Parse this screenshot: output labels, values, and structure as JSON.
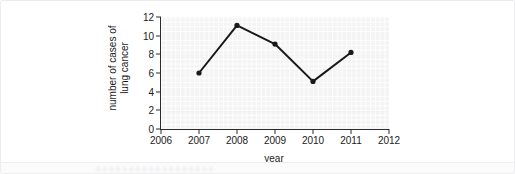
{
  "figure": {
    "background_color": "#ffffff",
    "plot_background_color": "#f4f4f5",
    "line_color": "#1a1a1a",
    "axis_color": "#2b2b2b"
  },
  "bottom_strip": {
    "obscured_text": "a a a a a a a a a a a a a a a a a a"
  },
  "chart_data": {
    "type": "line",
    "title": "",
    "xlabel": "year",
    "ylabel": "number of cases of lung cancer",
    "ylabel_lines": [
      "number of cases of",
      "lung cancer"
    ],
    "xlim": [
      2006,
      2012
    ],
    "ylim": [
      0,
      12
    ],
    "xticks": [
      2006,
      2007,
      2008,
      2009,
      2010,
      2011,
      2012
    ],
    "yticks": [
      0,
      2,
      4,
      6,
      8,
      10,
      12
    ],
    "xtick_labels": [
      "2006",
      "2007",
      "2008",
      "2009",
      "2010",
      "2011",
      "2012"
    ],
    "ytick_labels": [
      "0",
      "2",
      "4",
      "6",
      "8",
      "10",
      "12"
    ],
    "grid": true,
    "legend": false,
    "marker": "circle",
    "x": [
      2007,
      2008,
      2009,
      2010,
      2011
    ],
    "values": [
      6.0,
      11.1,
      9.1,
      5.1,
      8.2
    ],
    "points": [
      {
        "year": 2007,
        "cases": 6.0
      },
      {
        "year": 2008,
        "cases": 11.1
      },
      {
        "year": 2009,
        "cases": 9.1
      },
      {
        "year": 2010,
        "cases": 5.1
      },
      {
        "year": 2011,
        "cases": 8.2
      }
    ]
  }
}
